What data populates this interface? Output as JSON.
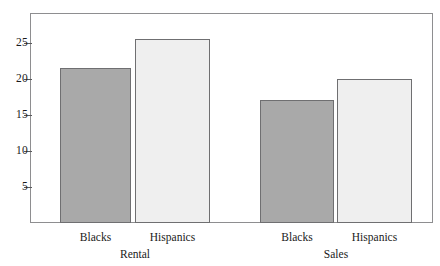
{
  "chart_data": {
    "type": "bar",
    "title": "",
    "subtitle": "",
    "xlabel": "",
    "ylabel": "",
    "ylim": [
      0,
      29
    ],
    "yticks": [
      5,
      10,
      15,
      20,
      25
    ],
    "ytick_labels": [
      "5",
      "10",
      "15",
      "20",
      "25"
    ],
    "grid": false,
    "legend": "none",
    "groups": [
      {
        "name": "Rental",
        "bars": [
          {
            "category": "Blacks",
            "value": 21.5,
            "color": "#a9a9a9"
          },
          {
            "category": "Hispanics",
            "value": 25.6,
            "color": "#efefef"
          }
        ]
      },
      {
        "name": "Sales",
        "bars": [
          {
            "category": "Blacks",
            "value": 17.1,
            "color": "#a9a9a9"
          },
          {
            "category": "Hispanics",
            "value": 20.0,
            "color": "#efefef"
          }
        ]
      }
    ],
    "categories": [
      "Rental-Blacks",
      "Rental-Hispanics",
      "Sales-Blacks",
      "Sales-Hispanics"
    ],
    "values": [
      21.5,
      25.6,
      17.1,
      20.0
    ],
    "colors": {
      "dark_bar": "#a9a9a9",
      "light_bar": "#efefef",
      "bar_border": "#6f6f71",
      "frame": "#8e8e90"
    }
  },
  "axis": {
    "ticks": [
      {
        "label": "25",
        "value": 25
      },
      {
        "label": "20",
        "value": 20
      },
      {
        "label": "15",
        "value": 15
      },
      {
        "label": "10",
        "value": 10
      },
      {
        "label": "5",
        "value": 5
      }
    ]
  },
  "labels": {
    "bar_labels": [
      "Blacks",
      "Hispanics",
      "Blacks",
      "Hispanics"
    ],
    "group_labels": [
      "Rental",
      "Sales"
    ]
  }
}
